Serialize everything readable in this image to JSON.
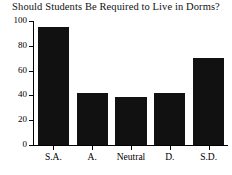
{
  "chart_data": {
    "type": "bar",
    "title": "Should Students Be Required to Live in Dorms?",
    "xlabel": "",
    "ylabel": "",
    "categories": [
      "S.A.",
      "A.",
      "Neutral",
      "D.",
      "S.D."
    ],
    "values": [
      95,
      42,
      39,
      42,
      70
    ],
    "ylim": [
      0,
      100
    ],
    "yticks": [
      0,
      20,
      40,
      60,
      80,
      100
    ],
    "ytick_labels": [
      "0",
      "20",
      "40",
      "60",
      "80",
      "100"
    ],
    "grid": false,
    "legend": null,
    "bar_color": "#111111",
    "axis_color": "#000000",
    "background_color": "#ffffff"
  }
}
